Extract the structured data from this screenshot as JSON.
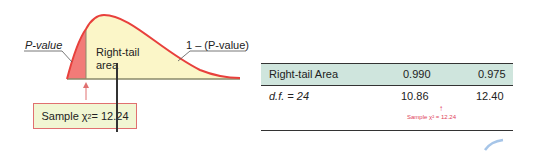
{
  "diagram": {
    "curve_labels": {
      "p_value": "P-value",
      "right_tail_line1": "Right-tail",
      "right_tail_line2": "area",
      "complement": "1 – (P-value)"
    },
    "sample_box": {
      "prefix": "Sample χ",
      "exponent": "2",
      "suffix": " = 12.24"
    },
    "colors": {
      "curve": "#e8403c",
      "left_tail_fill": "#f27b78",
      "right_area_fill": "#fbf6c8",
      "axis": "#8a8a6a",
      "box_fill": "#f1f6d3",
      "table_header": "#cfe5dd",
      "note_red": "#e0405a"
    }
  },
  "table": {
    "header": {
      "label": "Right-tail Area",
      "values": [
        "0.990",
        "0.975"
      ]
    },
    "row": {
      "label": "d.f. = 24",
      "values": [
        "10.86",
        "12.40"
      ]
    },
    "annotation": {
      "arrow": "↑",
      "text": "Sample χ² = 12.24"
    }
  }
}
